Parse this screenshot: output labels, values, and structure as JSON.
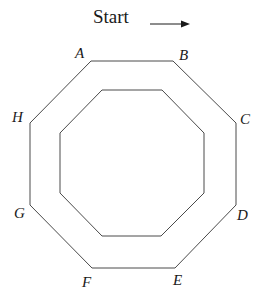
{
  "start": {
    "label": "Start",
    "arrow_icon": "right-arrow"
  },
  "vertices": {
    "A": "A",
    "B": "B",
    "C": "C",
    "D": "D",
    "E": "E",
    "F": "F",
    "G": "G",
    "H": "H"
  },
  "outer_octagon": "91,61 173,61 236,123 236,205 175,268 92,268 30,205 30,123",
  "inner_octagon": "102,90 162,90 204,133 204,193 161,236 102,236 60,193 60,133",
  "colors": {
    "stroke": "#4a4a4a",
    "text": "#1a1a1a",
    "background": "#ffffff"
  }
}
